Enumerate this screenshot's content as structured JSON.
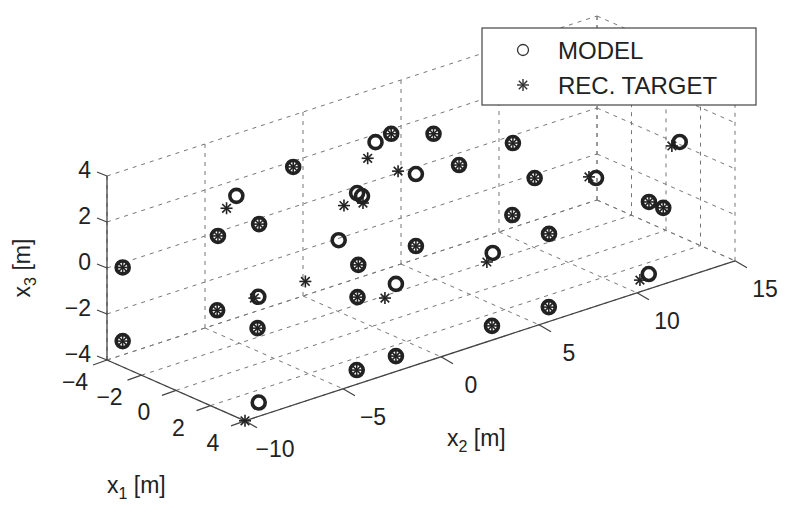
{
  "chart_data": {
    "type": "scatter",
    "projection": "3d",
    "title": "",
    "xlabel": "x1 [m]",
    "ylabel": "x2 [m]",
    "zlabel": "x3 [m]",
    "axis_labels": {
      "x1": {
        "main": "x",
        "sub": "1",
        "unit": " [m]"
      },
      "x2": {
        "main": "x",
        "sub": "2",
        "unit": " [m]"
      },
      "x3": {
        "main": "x",
        "sub": "3",
        "unit": " [m]"
      }
    },
    "xlim": [
      -4,
      4
    ],
    "ylim": [
      -10,
      15
    ],
    "zlim": [
      -4,
      4
    ],
    "x1_ticks": [
      -4,
      -2,
      0,
      2,
      4
    ],
    "x1_tick_labels": [
      "−4",
      "−2",
      "0",
      "2",
      "4"
    ],
    "x2_ticks": [
      -10,
      -5,
      0,
      5,
      10,
      15
    ],
    "x2_tick_labels": [
      "−10",
      "−5",
      "0",
      "5",
      "10",
      "15"
    ],
    "x3_ticks": [
      -4,
      -2,
      0,
      2,
      4
    ],
    "x3_tick_labels": [
      "−4",
      "−2",
      "0",
      "2",
      "4"
    ],
    "grid": true,
    "legend": {
      "placement": "top-right",
      "entries": [
        {
          "label": "MODEL",
          "marker": "circle"
        },
        {
          "label": "REC. TARGET",
          "marker": "asterisk"
        }
      ]
    },
    "series": [
      {
        "name": "MODEL",
        "marker": "circle",
        "points": [
          [
            -4,
            -9.2,
            -0.2
          ],
          [
            -4,
            -9.2,
            -3.4
          ],
          [
            -4,
            -3.4,
            1.3
          ],
          [
            -2,
            -6.1,
            0.97
          ],
          [
            -2,
            -4.0,
            0.9
          ],
          [
            -4,
            -0.5,
            1.75
          ],
          [
            0,
            -7.9,
            -1.1
          ],
          [
            0,
            -5.8,
            -1.1
          ],
          [
            2,
            -7.6,
            -1.3
          ],
          [
            4,
            -9.3,
            -3.4
          ],
          [
            -4,
            3.7,
            1.66
          ],
          [
            -4,
            4.5,
            1.8
          ],
          [
            -2,
            4.9,
            2.35
          ],
          [
            -2,
            1.0,
            0.86
          ],
          [
            -2,
            1.25,
            0.66
          ],
          [
            -2,
            4.0,
            0.85
          ],
          [
            -2,
            6.2,
            0.63
          ],
          [
            0,
            -1.7,
            0.22
          ],
          [
            0,
            -0.7,
            -1.13
          ],
          [
            2,
            -2.5,
            -1.37
          ],
          [
            2,
            -0.54,
            -1.34
          ],
          [
            0,
            2.24,
            -1.13
          ],
          [
            4,
            -4.3,
            -3.38
          ],
          [
            4,
            -2.3,
            -3.33
          ],
          [
            -2,
            8.95,
            0.82
          ],
          [
            0,
            8.3,
            0.14
          ],
          [
            2,
            5.4,
            0.0
          ],
          [
            2,
            4.4,
            -1.37
          ],
          [
            2,
            7.27,
            -1.34
          ],
          [
            0,
            11.43,
            -0.73
          ],
          [
            4,
            2.6,
            -3.38
          ],
          [
            4,
            5.5,
            -3.37
          ],
          [
            0,
            15.7,
            -0.35
          ],
          [
            2,
            12.37,
            -1.37
          ],
          [
            2,
            13.1,
            -1.83
          ],
          [
            4,
            10.6,
            -3.35
          ]
        ]
      },
      {
        "name": "REC. TARGET",
        "marker": "asterisk",
        "points": [
          [
            -4,
            -9.2,
            -0.2
          ],
          [
            -4,
            -9.2,
            -3.4
          ],
          [
            -4,
            -3.9,
            0.9
          ],
          [
            -2,
            -6.1,
            0.97
          ],
          [
            -2,
            -4.0,
            0.9
          ],
          [
            -4,
            -0.5,
            1.75
          ],
          [
            0,
            -7.9,
            -1.1
          ],
          [
            0,
            -6.0,
            -1.1
          ],
          [
            2,
            -7.6,
            -1.3
          ],
          [
            4,
            -10.0,
            -4.0
          ],
          [
            -4,
            3.3,
            1.07
          ],
          [
            -4,
            4.5,
            1.8
          ],
          [
            -2,
            4.9,
            2.35
          ],
          [
            -2,
            0.33,
            0.5
          ],
          [
            -2,
            1.3,
            0.34
          ],
          [
            -2,
            3.09,
            1.23
          ],
          [
            -2,
            6.2,
            0.63
          ],
          [
            0,
            -3.4,
            -1.1
          ],
          [
            0,
            -0.7,
            -1.13
          ],
          [
            2,
            -2.5,
            -1.37
          ],
          [
            2,
            -1.1,
            -1.8
          ],
          [
            0,
            2.24,
            -1.13
          ],
          [
            4,
            -4.3,
            -3.38
          ],
          [
            4,
            -2.3,
            -3.33
          ],
          [
            -2,
            8.95,
            0.82
          ],
          [
            0,
            8.3,
            0.14
          ],
          [
            2,
            5.4,
            0.0
          ],
          [
            2,
            4.1,
            -1.68
          ],
          [
            2,
            7.27,
            -1.34
          ],
          [
            0,
            11.07,
            -0.58
          ],
          [
            4,
            2.6,
            -3.38
          ],
          [
            4,
            5.5,
            -3.37
          ],
          [
            0,
            15.3,
            -0.41
          ],
          [
            2,
            12.37,
            -1.37
          ],
          [
            2,
            13.1,
            -1.83
          ],
          [
            4,
            10.15,
            -3.49
          ]
        ]
      }
    ]
  }
}
